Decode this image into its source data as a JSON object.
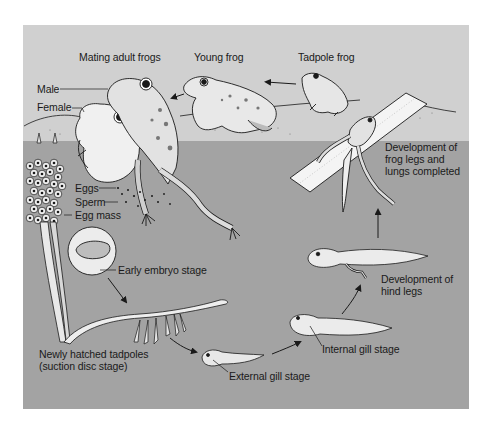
{
  "figure": {
    "colors": {
      "page_background": "#ffffff",
      "land_sky": "#d0d0d0",
      "water": "#a3a3a3",
      "ink": "#1a1a1a",
      "body_light": "#efefef"
    },
    "labels": {
      "mating_adult_frogs": "Mating adult frogs",
      "young_frog": "Young frog",
      "tadpole_frog": "Tadpole frog",
      "male": "Male",
      "female": "Female",
      "eggs": "Eggs",
      "sperm": "Sperm",
      "egg_mass": "Egg mass",
      "early_embryo_stage": "Early embryo stage",
      "newly_hatched_tadpoles": "Newly hatched tadpoles\n(suction disc stage)",
      "external_gill_stage": "External gill stage",
      "internal_gill_stage": "Internal gill stage",
      "development_hind_legs": "Development of\nhind legs",
      "development_frog_legs_lungs": "Development of\nfrog legs and\nlungs completed"
    },
    "cycle_sequence": [
      "Mating adult frogs",
      "Eggs / Sperm / Egg mass",
      "Early embryo stage",
      "Newly hatched tadpoles (suction disc stage)",
      "External gill stage",
      "Internal gill stage",
      "Development of hind legs",
      "Development of frog legs and lungs completed",
      "Tadpole frog",
      "Young frog"
    ]
  }
}
